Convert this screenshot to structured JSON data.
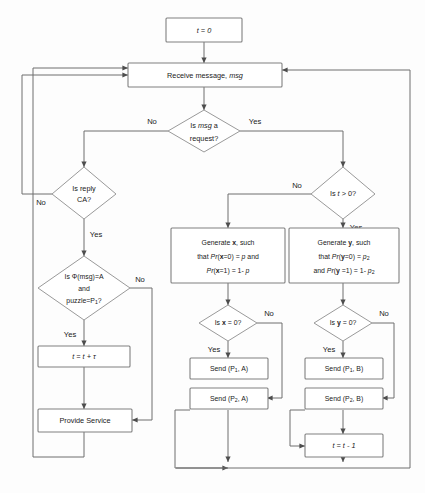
{
  "diagram": {
    "type": "flowchart",
    "colors": {
      "background": "#fdfdfd",
      "node_fill": "#ffffff",
      "node_stroke": "#808080",
      "edge_stroke": "#6e6e6e",
      "text": "#1a1a1a"
    }
  },
  "nodes": {
    "init": {
      "label": "t = 0",
      "shape": "rectangle"
    },
    "receive": {
      "label": "Receive message, msg",
      "shape": "rectangle"
    },
    "is_request": {
      "label_line1": "Is msg a",
      "label_line2": "request?",
      "shape": "diamond"
    },
    "is_reply_ca": {
      "label_line1": "Is reply",
      "label_line2": "CA?",
      "shape": "diamond"
    },
    "is_phi": {
      "label_line1": "Is Φ(msg)=A",
      "label_line2": "and",
      "label_line3": "puzzle=P",
      "label_line3_sub": "1",
      "label_line3_tail": "?",
      "shape": "diamond"
    },
    "t_plus": {
      "label": "t = t + τ",
      "shape": "rectangle"
    },
    "provide_service": {
      "label": "Provide Service",
      "shape": "rectangle"
    },
    "is_t_gt_0": {
      "label": "Is t > 0?",
      "shape": "diamond"
    },
    "gen_x": {
      "line1": "Generate x, such",
      "line2": "that Pr(x=0) = p and",
      "line3": "Pr(x=1) = 1- p",
      "shape": "rectangle"
    },
    "gen_y": {
      "line1": "Generate y, such",
      "line2": "that Pr(y=0) = p",
      "line2_sub": "2",
      "line3": "and Pr(y =1) = 1- p",
      "line3_sub": "2",
      "shape": "rectangle"
    },
    "is_x_0": {
      "label": "Is x = 0?",
      "shape": "diamond"
    },
    "is_y_0": {
      "label": "Is y = 0?",
      "shape": "diamond"
    },
    "send_p1_a": {
      "label": "Send (P",
      "sub": "1",
      "tail": ", A)",
      "shape": "rectangle"
    },
    "send_p2_a": {
      "label": "Send (P",
      "sub": "2",
      "tail": ", A)",
      "shape": "rectangle"
    },
    "send_p1_b": {
      "label": "Send (P",
      "sub": "1",
      "tail": ", B)",
      "shape": "rectangle"
    },
    "send_p2_b": {
      "label": "Send (P",
      "sub": "2",
      "tail": ", B)",
      "shape": "rectangle"
    },
    "t_minus": {
      "label": "t = t - 1",
      "shape": "rectangle"
    }
  },
  "edge_labels": {
    "request_no": "No",
    "request_yes": "Yes",
    "reply_ca_no": "No",
    "reply_ca_yes": "Yes",
    "phi_no": "No",
    "phi_yes": "Yes",
    "t_gt_0_no": "No",
    "t_gt_0_yes": "Yes",
    "x_0_no": "No",
    "x_0_yes": "Yes",
    "y_0_no": "No",
    "y_0_yes": "Yes"
  }
}
